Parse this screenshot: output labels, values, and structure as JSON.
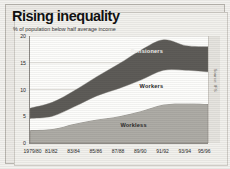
{
  "chart_data": {
    "type": "area",
    "title": "Rising inequality",
    "subtitle": "% of population below half average income",
    "xlabel": "",
    "ylabel": "",
    "ylim": [
      0,
      20
    ],
    "yticks": [
      0,
      5,
      10,
      15,
      20
    ],
    "grid": true,
    "stacked": true,
    "legend_position": "inline-labels",
    "source": "Source: IFS",
    "categories": [
      "1979/80",
      "81/82",
      "83/84",
      "85/86",
      "87/88",
      "89/90",
      "91/92",
      "93/94",
      "95/96"
    ],
    "x": [
      0,
      1,
      2,
      3,
      4,
      5,
      6,
      7,
      8
    ],
    "series": [
      {
        "name": "Workless",
        "color": "#aeaca6",
        "values": [
          2.4,
          2.6,
          3.6,
          4.4,
          5.0,
          6.0,
          7.2,
          7.4,
          7.3
        ]
      },
      {
        "name": "Workers",
        "color": "#fdfdfb",
        "values": [
          2.2,
          2.4,
          3.2,
          4.4,
          5.2,
          5.8,
          6.4,
          6.2,
          6.0
        ]
      },
      {
        "name": "Pensioners",
        "color": "#5e5c58",
        "values": [
          1.9,
          2.6,
          3.0,
          3.6,
          4.6,
          5.6,
          5.7,
          4.6,
          4.7
        ]
      }
    ],
    "totals": [
      6.5,
      7.6,
      9.8,
      12.4,
      14.8,
      17.4,
      19.3,
      18.2,
      18.0
    ],
    "annotations": [
      {
        "label": "Pensioners",
        "x_index": 5.3,
        "value_y": 17.0
      },
      {
        "label": "Workers",
        "x_index": 5.5,
        "value_y": 10.4
      },
      {
        "label": "Workless",
        "x_index": 4.7,
        "value_y": 3.1
      }
    ]
  }
}
